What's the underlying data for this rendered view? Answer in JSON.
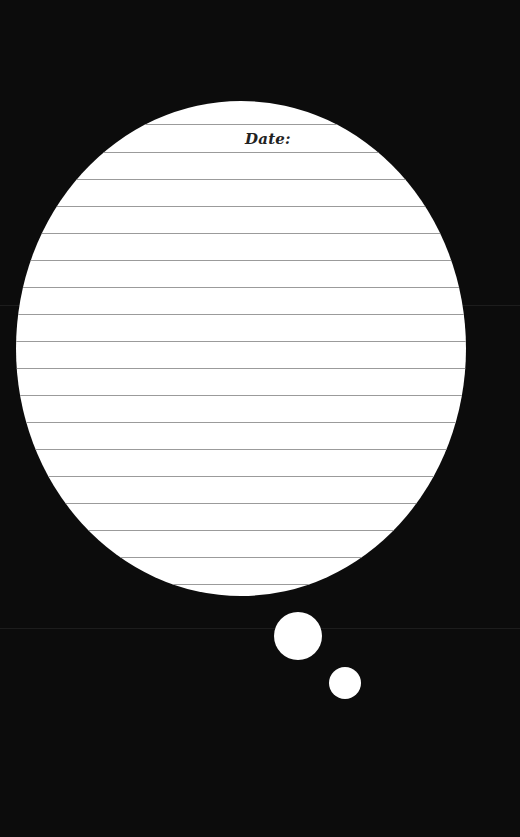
{
  "page": {
    "background_color": "#0c0c0c",
    "paper_color": "#ffffff",
    "rule_color": "#9b9b9b",
    "text_color": "#222222"
  },
  "thought_bubble": {
    "date_label": "Date:",
    "ruled_line_count": 18,
    "ruled_line_y_positions": [
      23,
      51,
      78,
      105,
      132,
      159,
      186,
      213,
      240,
      267,
      294,
      321,
      348,
      375,
      402,
      429,
      456,
      483
    ]
  },
  "trail_dots": [
    {
      "cx": 298,
      "cy": 636,
      "r": 24
    },
    {
      "cx": 345,
      "cy": 683,
      "r": 16
    }
  ],
  "background_streaks_y": [
    305,
    628
  ]
}
